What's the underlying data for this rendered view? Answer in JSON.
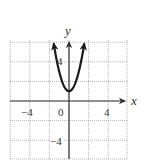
{
  "chart_data": {
    "type": "line",
    "title": "",
    "xlabel": "x",
    "ylabel": "y",
    "xlim": [
      -6,
      6
    ],
    "ylim": [
      -6,
      6
    ],
    "grid": true,
    "grid_step": 2,
    "x_tick_labels": [
      {
        "value": -4,
        "text": "−4"
      },
      {
        "value": 0,
        "text": "0"
      },
      {
        "value": 4,
        "text": "4"
      }
    ],
    "y_tick_labels": [
      {
        "value": 4,
        "text": "4"
      },
      {
        "value": -4,
        "text": "−4"
      }
    ],
    "series": [
      {
        "name": "parabola",
        "equation": "y = 2x^2 + 1",
        "vertex": [
          0,
          1
        ],
        "x_range": [
          -1.55,
          1.55
        ],
        "arrows_at_ends": true,
        "color": "#1a1a1a"
      }
    ]
  },
  "labels": {
    "x_axis": "x",
    "y_axis": "y",
    "x_minus4": "−4",
    "x_zero": "0",
    "x_plus4": "4",
    "y_plus4": "4",
    "y_minus4": "−4"
  },
  "colors": {
    "grid": "#9a9a9a",
    "axis": "#333333",
    "curve": "#1a1a1a"
  }
}
